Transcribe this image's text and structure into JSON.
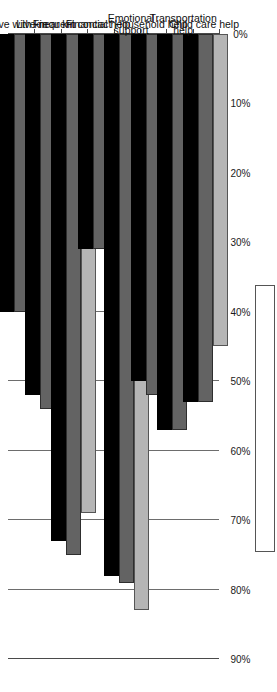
{
  "figure": {
    "background_color": "#ffffff",
    "orientation": "rotated-90-horizontal-bar",
    "legend_present": true,
    "legend_empty": true
  },
  "chart_data": {
    "type": "bar",
    "title": "",
    "subtitle": "",
    "xlabel": "",
    "ylabel": "",
    "orientation": "horizontal",
    "grid": true,
    "legend_position": "right",
    "legend_entries": [],
    "axis_ticks": [
      "90%",
      "80%",
      "70%",
      "60%",
      "50%",
      "40%",
      "30%",
      "20%",
      "10%",
      "0%"
    ],
    "value_axis_range": [
      0,
      90
    ],
    "value_axis_unit": "%",
    "value_axis_direction": "right-to-left",
    "categories": [
      "Live with kin",
      "Live near kin",
      "Frequent contact",
      "Financial help",
      "Emotional\nsupport",
      "Household help",
      "Transportation\nhelp",
      "Child care help"
    ],
    "series": [
      {
        "name": "Series 1",
        "color": "#b5b5b5",
        "values": [
          22,
          41,
          69,
          47,
          83,
          47,
          50,
          45
        ]
      },
      {
        "name": "Series 2",
        "color": "#636363",
        "values": [
          40,
          54,
          75,
          31,
          79,
          52,
          57,
          53
        ]
      },
      {
        "name": "Series 3",
        "color": "#000000",
        "values": [
          40,
          52,
          73,
          31,
          78,
          50,
          57,
          53
        ]
      }
    ]
  }
}
